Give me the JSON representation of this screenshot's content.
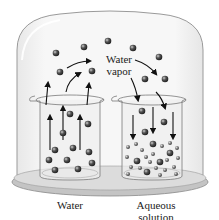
{
  "diagram": {
    "title": "",
    "vapor_label_line1": "Water",
    "vapor_label_line2": "vapor",
    "left_beaker_label": "Water",
    "right_beaker_label_line1": "Aqueous",
    "right_beaker_label_line2": "solution",
    "colors": {
      "dome_edge": "#9a9a9a",
      "dome_fill": "#f2f2f2",
      "molecule": "#3a3a3a",
      "arrow": "#111111",
      "base_plate": "#b5b5b5"
    },
    "components": [
      "bell-jar",
      "water-beaker",
      "aqueous-solution-beaker",
      "base-plate",
      "water-vapor-molecules",
      "evaporation-arrows",
      "condensation-arrows"
    ]
  }
}
